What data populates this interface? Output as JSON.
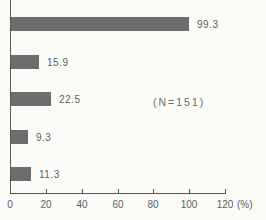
{
  "chart_data": {
    "type": "bar",
    "orientation": "horizontal",
    "values": [
      99.3,
      15.9,
      22.5,
      9.3,
      11.3
    ],
    "value_labels": [
      "99.3",
      "15.9",
      "22.5",
      "9.3",
      "11.3"
    ],
    "annotation": "(N=151)",
    "xlabel": "(%)",
    "xlim": [
      0,
      120
    ],
    "x_ticks": [
      0,
      20,
      40,
      60,
      80,
      100,
      120
    ],
    "grid": false,
    "legend": false,
    "colors": {
      "bar": "#6d6d6d",
      "axis": "#565656",
      "text": "#5d5d5d",
      "background": "#fbfbf8"
    }
  }
}
